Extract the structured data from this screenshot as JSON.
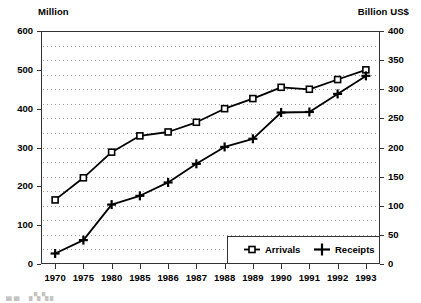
{
  "chart_data": {
    "type": "line",
    "title": "",
    "subtitle": "",
    "xlabel": "",
    "ylabel": "Million",
    "y2label": "Billion US$",
    "categories": [
      "1970",
      "1975",
      "1980",
      "1985",
      "1986",
      "1987",
      "1988",
      "1989",
      "1990",
      "1991",
      "1992",
      "1993"
    ],
    "grid": true,
    "grid_orientation": "horizontal-dotted",
    "legend_position": "bottom-right",
    "axes": {
      "left": {
        "label": "Million",
        "ticks": [
          0,
          100,
          200,
          300,
          400,
          500,
          600
        ],
        "ylim": [
          0,
          600
        ]
      },
      "right": {
        "label": "Billion US$",
        "ticks": [
          0,
          50,
          100,
          150,
          200,
          250,
          300,
          350,
          400
        ],
        "ylim": [
          0,
          400
        ]
      },
      "x": {
        "ticks": [
          "1970",
          "1975",
          "1980",
          "1985",
          "1986",
          "1987",
          "1988",
          "1989",
          "1990",
          "1991",
          "1992",
          "1993"
        ]
      }
    },
    "series": [
      {
        "name": "Arrivals",
        "axis": "left",
        "unit": "Million",
        "marker": "open-square",
        "values": [
          165,
          222,
          288,
          330,
          340,
          365,
          400,
          426,
          455,
          450,
          475,
          500
        ]
      },
      {
        "name": "Receipts",
        "axis": "right",
        "unit": "Billion US$",
        "marker": "plus",
        "values": [
          18,
          41,
          102,
          117,
          140,
          172,
          201,
          215,
          260,
          261,
          292,
          323
        ]
      }
    ]
  },
  "legend": {
    "items": [
      {
        "label": "Arrivals",
        "marker": "open-square"
      },
      {
        "label": "Receipts",
        "marker": "plus"
      }
    ]
  },
  "colors": {
    "series_line": "#000000",
    "axis": "#333333",
    "grid": "#999999",
    "background": "#ffffff"
  }
}
